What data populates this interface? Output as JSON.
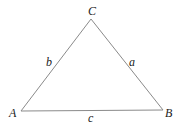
{
  "diagram": {
    "type": "triangle",
    "colors": {
      "stroke": "#8a8a8a",
      "text": "#222222",
      "background": "#ffffff"
    },
    "vertices": [
      {
        "id": "A",
        "label": "A",
        "x": 21,
        "y": 111
      },
      {
        "id": "B",
        "label": "B",
        "x": 163,
        "y": 110
      },
      {
        "id": "C",
        "label": "C",
        "x": 91,
        "y": 19
      }
    ],
    "sides": [
      {
        "id": "a",
        "label": "a",
        "from": "B",
        "to": "C"
      },
      {
        "id": "b",
        "label": "b",
        "from": "A",
        "to": "C"
      },
      {
        "id": "c",
        "label": "c",
        "from": "A",
        "to": "B"
      }
    ]
  }
}
